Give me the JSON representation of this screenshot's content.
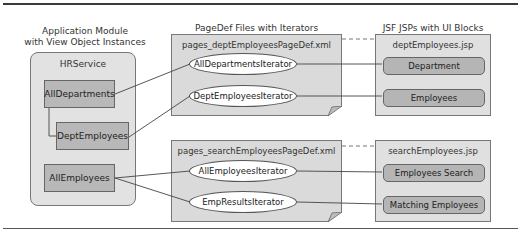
{
  "headings": {
    "app_module": "Application Module\nwith View Object Instances",
    "app_module_line1": "Application Module",
    "app_module_line2": "with View Object Instances",
    "pagedef": "PageDef Files with Iterators",
    "jsp": "JSF JSPs with UI Blocks"
  },
  "app_module": {
    "name": "HRService",
    "view_objects": [
      {
        "label": "AllDepartments"
      },
      {
        "label": "DeptEmployees"
      },
      {
        "label": "AllEmployees"
      }
    ]
  },
  "pagedefs": [
    {
      "file": "pages_deptEmployeesPageDef.xml",
      "iterators": [
        {
          "label": "AllDepartmentsIterator"
        },
        {
          "label": "DeptEmployeesIterator"
        }
      ]
    },
    {
      "file": "pages_searchEmployeesPageDef.xml",
      "iterators": [
        {
          "label": "AllEmployeesIterator"
        },
        {
          "label": "EmpResultsIterator"
        }
      ]
    }
  ],
  "jsps": [
    {
      "file": "deptEmployees.jsp",
      "blocks": [
        {
          "label": "Department"
        },
        {
          "label": "Employees"
        }
      ]
    },
    {
      "file": "searchEmployees.jsp",
      "blocks": [
        {
          "label": "Employees Search"
        },
        {
          "label": "Matching Employees"
        }
      ]
    }
  ],
  "colors": {
    "vo_fill": "#b8b8b8",
    "container_fill": "#e2e2e2",
    "pagedef_fill": "#dadada",
    "iterator_fill": "#ffffff",
    "ui_block_fill": "#b5b5b5"
  }
}
